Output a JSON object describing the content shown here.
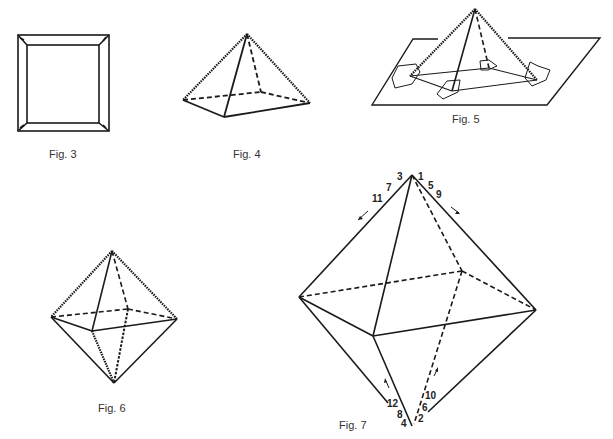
{
  "figures": [
    {
      "id": "fig3",
      "caption": "Fig. 3",
      "subject": "square frame with mitered corners"
    },
    {
      "id": "fig4",
      "caption": "Fig. 4",
      "subject": "square pyramid with serrated edges"
    },
    {
      "id": "fig5",
      "caption": "Fig. 5",
      "subject": "pyramid taped to flat sheet"
    },
    {
      "id": "fig6",
      "caption": "Fig. 6",
      "subject": "octahedron with serrated edges"
    },
    {
      "id": "fig7",
      "caption": "Fig. 7",
      "subject": "octahedron with numbered cut sequence"
    }
  ],
  "fig7_labels": {
    "top_left": [
      "3",
      "7",
      "11"
    ],
    "top_right": [
      "1",
      "5",
      "9"
    ],
    "bottom_left": [
      "12",
      "8",
      "4"
    ],
    "bottom_right": [
      "10",
      "6",
      "2"
    ]
  },
  "colors": {
    "line": "#1a1a1a",
    "caption": "#333333",
    "background": "#ffffff"
  }
}
